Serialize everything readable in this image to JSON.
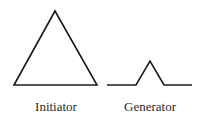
{
  "diagram": {
    "colors": {
      "stroke": "#1a1a1a",
      "text": "#2a2a2a",
      "background": "#ffffff"
    },
    "initiator": {
      "label": "Initiator",
      "shape": "equilateral-triangle",
      "points": "14,85 55,11 97,85"
    },
    "generator": {
      "label": "Generator",
      "shape": "koch-generator",
      "points": "107,85 136,85 150,61 164,85 192,85"
    }
  }
}
